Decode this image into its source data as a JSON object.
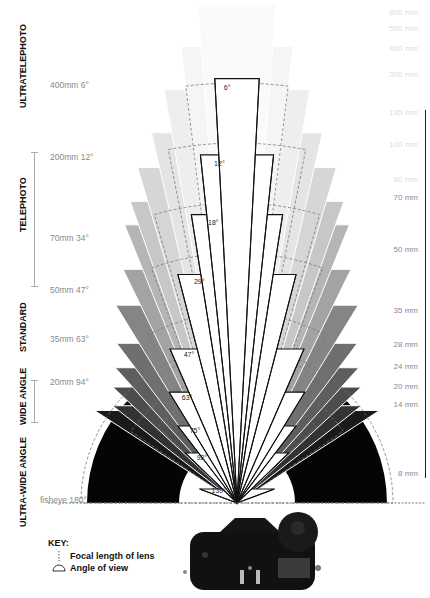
{
  "categories": [
    {
      "label": "ULTRATELEPHOTO",
      "x": 18,
      "y": 108
    },
    {
      "label": "TELEPHOTO",
      "x": 18,
      "y": 232
    },
    {
      "label": "STANDARD",
      "x": 18,
      "y": 352
    },
    {
      "label": "WIDE ANGLE",
      "x": 18,
      "y": 425
    },
    {
      "label": "ULTRA-WIDE ANGLE",
      "x": 18,
      "y": 527
    }
  ],
  "left_labels": [
    {
      "text": "400mm 6°",
      "x": 50,
      "y": 80
    },
    {
      "text": "200mm 12°",
      "x": 50,
      "y": 152
    },
    {
      "text": "70mm 34°",
      "x": 50,
      "y": 233
    },
    {
      "text": "50mm 47°",
      "x": 50,
      "y": 285
    },
    {
      "text": "35mm 63°",
      "x": 50,
      "y": 334
    },
    {
      "text": "20mm 94°",
      "x": 50,
      "y": 377
    },
    {
      "text": "fisheye 180°",
      "x": 40,
      "y": 495
    }
  ],
  "right_labels": [
    {
      "text": "800 mm",
      "y": 8,
      "faint": true
    },
    {
      "text": "500 mm",
      "y": 24,
      "faint": true
    },
    {
      "text": "400 mm",
      "y": 44,
      "faint": true
    },
    {
      "text": "300 mm",
      "y": 70,
      "faint": true
    },
    {
      "text": "135 mm",
      "y": 108,
      "faint": true
    },
    {
      "text": "100 mm",
      "y": 140,
      "faint": true
    },
    {
      "text": "80 mm",
      "y": 175,
      "faint": true
    },
    {
      "text": "70 mm",
      "y": 193,
      "faint": false
    },
    {
      "text": "50 mm",
      "y": 245,
      "faint": false
    },
    {
      "text": "35 mm",
      "y": 306,
      "faint": false
    },
    {
      "text": "28 mm",
      "y": 340,
      "faint": false
    },
    {
      "text": "24 mm",
      "y": 362,
      "faint": false
    },
    {
      "text": "20 mm",
      "y": 382,
      "faint": false
    },
    {
      "text": "14 mm",
      "y": 400,
      "faint": false
    },
    {
      "text": "8 mm",
      "y": 469,
      "faint": false
    }
  ],
  "fan": {
    "apex_x": 237,
    "apex_y": 503,
    "grey_wedges": [
      {
        "angle": 180,
        "r": 150,
        "color": "#050505",
        "inner": 58
      },
      {
        "angle": 114,
        "r": 170,
        "color": "#1a1a1a"
      },
      {
        "angle": 104,
        "r": 158,
        "color": "#333333"
      },
      {
        "angle": 94,
        "r": 170,
        "color": "#4d4d4d"
      },
      {
        "angle": 84,
        "r": 182,
        "color": "#5e5e5e"
      },
      {
        "angle": 74,
        "r": 200,
        "color": "#6f6f6f"
      },
      {
        "angle": 63,
        "r": 232,
        "color": "#858585"
      },
      {
        "angle": 52,
        "r": 260,
        "color": "#a3a3a3"
      },
      {
        "angle": 44,
        "r": 300,
        "color": "#b5b5b5"
      },
      {
        "angle": 39,
        "r": 320,
        "color": "#c7c7c7"
      },
      {
        "angle": 33,
        "r": 350,
        "color": "#d6d6d6"
      },
      {
        "angle": 26,
        "r": 380,
        "color": "#e4e4e4"
      },
      {
        "angle": 20,
        "r": 420,
        "color": "#eeeeee"
      },
      {
        "angle": 14,
        "r": 460,
        "color": "#f5f5f5"
      },
      {
        "angle": 9,
        "r": 500,
        "color": "#fafafa"
      }
    ],
    "view_wedges": [
      {
        "angle": 139,
        "r": 40,
        "label": "139°"
      },
      {
        "angle": 92,
        "r": 72,
        "label": "92°"
      },
      {
        "angle": 75,
        "r": 97,
        "label": "75°"
      },
      {
        "angle": 63,
        "r": 130,
        "label": "63°"
      },
      {
        "angle": 47,
        "r": 168,
        "label": "47°"
      },
      {
        "angle": 29,
        "r": 236,
        "label": "29°"
      },
      {
        "angle": 18,
        "r": 292,
        "label": "18°"
      },
      {
        "angle": 12,
        "r": 350,
        "label": "12°"
      },
      {
        "angle": 6,
        "r": 425,
        "label": "6°"
      }
    ],
    "dashed_arcs": [
      {
        "r": 156,
        "angle": 180
      },
      {
        "r": 128,
        "angle": 112
      },
      {
        "r": 110,
        "angle": 92
      },
      {
        "r": 150,
        "angle": 70
      },
      {
        "r": 190,
        "angle": 56
      },
      {
        "r": 250,
        "angle": 40
      },
      {
        "r": 300,
        "angle": 32
      },
      {
        "r": 360,
        "angle": 22
      },
      {
        "r": 420,
        "angle": 14
      }
    ]
  },
  "key": {
    "title": "KEY:",
    "items": [
      {
        "icon": "focal-length-icon",
        "label": "Focal length of lens"
      },
      {
        "icon": "angle-of-view-icon",
        "label": "Angle of view"
      }
    ]
  },
  "camera": {
    "alt": "DSLR camera top view"
  }
}
